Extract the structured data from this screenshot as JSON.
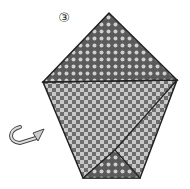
{
  "diagram": {
    "type": "origami-instruction",
    "step_label": "3",
    "step_symbol": "③",
    "colors": {
      "paper_dark": "#6e6e6e",
      "paper_light": "#c8c8c8",
      "outline": "#222222"
    },
    "shapes": {
      "top_triangle": "109,13 43,82 177,80",
      "body": "43,82 177,80 140,178 83,178",
      "bottom_flap": "115,150 83,178 140,178"
    },
    "icons": [
      "turn-over-arrow-icon"
    ]
  }
}
